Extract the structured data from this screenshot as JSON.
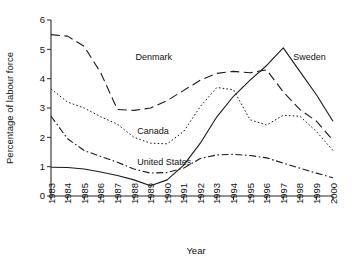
{
  "chart_data": {
    "type": "line",
    "title": "",
    "xlabel": "Year",
    "ylabel": "Percentage of labour force",
    "xlim": [
      1983,
      2000
    ],
    "ylim": [
      0,
      6
    ],
    "ytick_step": 1,
    "grid": false,
    "legend_position": "inline-annotations",
    "categories": [
      1983,
      1984,
      1985,
      1986,
      1987,
      1988,
      1989,
      1990,
      1991,
      1992,
      1993,
      1994,
      1995,
      1996,
      1997,
      1998,
      1999,
      2000
    ],
    "xtick_labels": [
      "1983",
      "1984",
      "1985",
      "1986",
      "1987",
      "1988",
      "1989",
      "1990",
      "1991",
      "1992",
      "1993",
      "1994",
      "1995",
      "1996",
      "1997",
      "1998",
      "1999",
      "2000"
    ],
    "ytick_labels": [
      "0",
      "1",
      "2",
      "3",
      "4",
      "5",
      "6"
    ],
    "series": [
      {
        "name": "Denmark",
        "dash": "long-dash",
        "label_x": 1988.1,
        "label_y": 4.62,
        "values": [
          5.5,
          5.45,
          5.1,
          4.2,
          2.95,
          2.92,
          3.0,
          3.25,
          3.6,
          3.95,
          4.18,
          4.25,
          4.2,
          4.3,
          3.55,
          2.95,
          2.55,
          1.9
        ]
      },
      {
        "name": "Sweden",
        "dash": "solid",
        "label_x": 1997.6,
        "label_y": 4.62,
        "values": [
          0.98,
          0.97,
          0.92,
          0.82,
          0.7,
          0.55,
          0.35,
          0.55,
          1.05,
          1.8,
          2.7,
          3.4,
          3.95,
          4.45,
          5.05,
          4.25,
          3.45,
          2.55
        ]
      },
      {
        "name": "Canada",
        "dash": "dotted",
        "label_x": 1988.2,
        "label_y": 2.1,
        "values": [
          3.65,
          3.2,
          3.0,
          2.7,
          2.45,
          2.0,
          1.8,
          1.78,
          2.2,
          3.05,
          3.7,
          3.62,
          2.6,
          2.42,
          2.75,
          2.72,
          2.2,
          1.55
        ]
      },
      {
        "name": "United States",
        "dash": "dash-dot",
        "label_x": 1988.2,
        "label_y": 1.05,
        "values": [
          2.72,
          1.95,
          1.55,
          1.35,
          1.15,
          0.92,
          0.78,
          0.8,
          0.95,
          1.28,
          1.4,
          1.42,
          1.38,
          1.3,
          1.12,
          0.95,
          0.78,
          0.62
        ]
      }
    ],
    "annotations": [
      {
        "text": "Denmark"
      },
      {
        "text": "Sweden"
      },
      {
        "text": "Canada"
      },
      {
        "text": "United States"
      }
    ]
  },
  "colors": {
    "ink": "#1a1a1a",
    "background": "#ffffff"
  }
}
